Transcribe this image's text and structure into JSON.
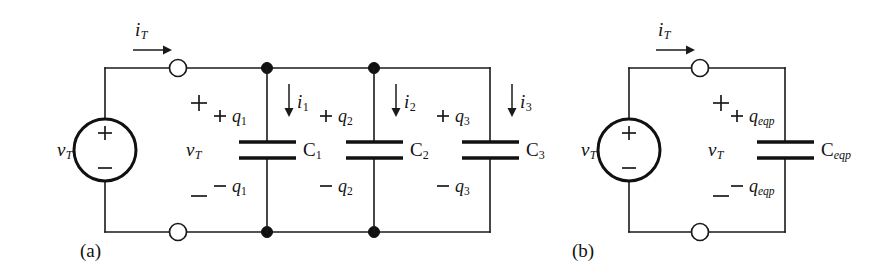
{
  "figure": {
    "type": "circuit-diagram",
    "background_color": "#ffffff",
    "line_color": "#1a1a1a"
  },
  "panels": [
    {
      "id": "a",
      "label": "(a)",
      "source": {
        "name": "voltage-source",
        "label": "v",
        "label_sub": "T",
        "plus": "+",
        "minus": "−"
      },
      "current": {
        "label": "i",
        "label_sub": "T"
      },
      "port_voltage": {
        "plus": "+",
        "label": "v",
        "label_sub": "T",
        "minus": "−"
      },
      "branches": [
        {
          "cap_label": "C",
          "cap_sub": "1",
          "current_label": "i",
          "current_sub": "1",
          "q_top_sign": "+",
          "q_top": "q",
          "q_top_sub": "1",
          "q_bot_sign": "−",
          "q_bot": "q",
          "q_bot_sub": "1"
        },
        {
          "cap_label": "C",
          "cap_sub": "2",
          "current_label": "i",
          "current_sub": "2",
          "q_top_sign": "+",
          "q_top": "q",
          "q_top_sub": "2",
          "q_bot_sign": "−",
          "q_bot": "q",
          "q_bot_sub": "2"
        },
        {
          "cap_label": "C",
          "cap_sub": "3",
          "current_label": "i",
          "current_sub": "3",
          "q_top_sign": "+",
          "q_top": "q",
          "q_top_sub": "3",
          "q_bot_sign": "−",
          "q_bot": "q",
          "q_bot_sub": "3"
        }
      ]
    },
    {
      "id": "b",
      "label": "(b)",
      "source": {
        "name": "voltage-source",
        "label": "v",
        "label_sub": "T",
        "plus": "+",
        "minus": "−"
      },
      "current": {
        "label": "i",
        "label_sub": "T"
      },
      "port_voltage": {
        "plus": "+",
        "label": "v",
        "label_sub": "T",
        "minus": "−"
      },
      "branches": [
        {
          "cap_label": "C",
          "cap_sub": "eqp",
          "q_top_sign": "+",
          "q_top": "q",
          "q_top_sub": "eqp",
          "q_bot_sign": "−",
          "q_bot": "q",
          "q_bot_sub": "eqp"
        }
      ]
    }
  ]
}
